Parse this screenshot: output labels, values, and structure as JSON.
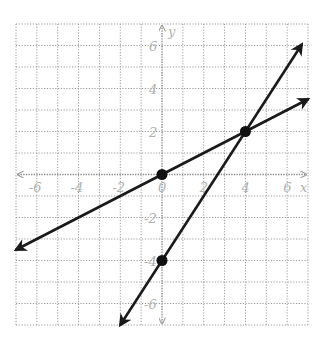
{
  "chart_data": {
    "type": "line",
    "title": "",
    "xlabel": "x",
    "ylabel": "y",
    "xlim": [
      -7,
      7
    ],
    "ylim": [
      -7,
      7
    ],
    "grid": true,
    "x_tick_labels": [
      "-6",
      "-4",
      "-2",
      "0",
      "2",
      "4",
      "6"
    ],
    "y_tick_labels": [
      "6",
      "4",
      "2",
      "-2",
      "-4",
      "-6"
    ],
    "series": [
      {
        "name": "line-1",
        "equation": "y = 0.5x",
        "x": [
          -7,
          7
        ],
        "y": [
          -3.5,
          3.5
        ],
        "arrows": "both"
      },
      {
        "name": "line-2",
        "equation": "y = 1.5x - 4",
        "x": [
          -2,
          6.7
        ],
        "y": [
          -7,
          6.05
        ],
        "arrows": "both"
      }
    ],
    "points": [
      {
        "x": 0,
        "y": 0,
        "label": "origin"
      },
      {
        "x": 4,
        "y": 2,
        "label": "intersection"
      },
      {
        "x": 0,
        "y": -4,
        "label": "y-intercept of line-2"
      }
    ],
    "colors": {
      "lines": "#1a1a1a",
      "grid": "#9a9a9a",
      "labels": "#b0b0b0"
    }
  }
}
